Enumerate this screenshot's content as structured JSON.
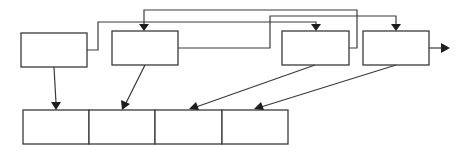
{
  "diagram": {
    "type": "block-flow",
    "colors": {
      "stroke": "#3a3a3a",
      "arrowhead": "#1e1e1e",
      "background": "#ffffff"
    },
    "top_boxes": [
      {
        "id": "A",
        "label": "",
        "x": 21,
        "y": 33,
        "w": 66,
        "h": 34
      },
      {
        "id": "B",
        "label": "",
        "x": 112,
        "y": 31,
        "w": 66,
        "h": 34
      },
      {
        "id": "C",
        "label": "",
        "x": 282,
        "y": 31,
        "w": 67,
        "h": 34
      },
      {
        "id": "D",
        "label": "",
        "x": 363,
        "y": 31,
        "w": 66,
        "h": 34
      }
    ],
    "bottom_row": {
      "x": 23,
      "y": 110,
      "w": 265,
      "h": 34,
      "cells": [
        {
          "id": "M1",
          "label": ""
        },
        {
          "id": "M2",
          "label": ""
        },
        {
          "id": "M3",
          "label": ""
        },
        {
          "id": "M4",
          "label": ""
        }
      ]
    },
    "connections": [
      {
        "from": "A",
        "to": "C",
        "route": "A-right up over to C-top"
      },
      {
        "from": "B",
        "to": "D",
        "route": "B-right up over to D-top"
      },
      {
        "from": "C",
        "to": "B",
        "route": "C-right up over back to B-top"
      },
      {
        "from": "A",
        "to": "M1"
      },
      {
        "from": "B",
        "to": "M2"
      },
      {
        "from": "C",
        "to": "M3"
      },
      {
        "from": "D",
        "to": "M4"
      },
      {
        "from": "D",
        "to": "output"
      }
    ]
  }
}
